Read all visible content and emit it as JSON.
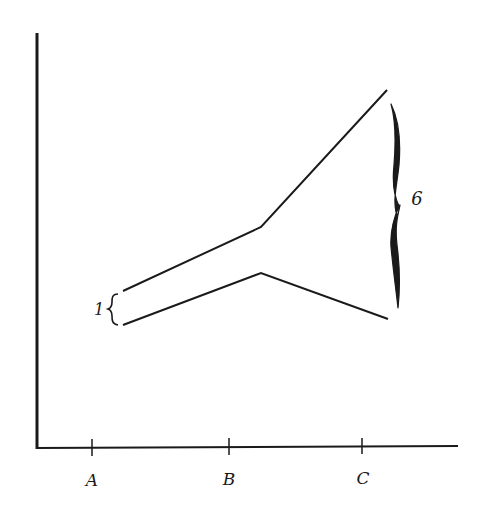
{
  "diagram": {
    "type": "diverging-lines",
    "axes": {
      "x_ticks": [
        {
          "label": "A",
          "x": 92
        },
        {
          "label": "B",
          "x": 229
        },
        {
          "label": "C",
          "x": 362
        }
      ]
    },
    "upper_line": {
      "points": [
        [
          123,
          291
        ],
        [
          261,
          227
        ],
        [
          387,
          90
        ]
      ]
    },
    "lower_line": {
      "points": [
        [
          123,
          325
        ],
        [
          261,
          273
        ],
        [
          388,
          319
        ]
      ]
    },
    "left_brace": {
      "label": "1"
    },
    "right_brace": {
      "label": "6"
    },
    "stroke_color": "#1a1a1a"
  }
}
